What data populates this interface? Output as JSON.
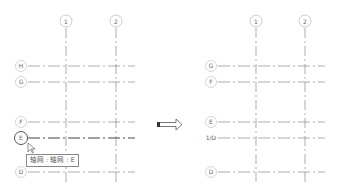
{
  "before": {
    "columns": [
      {
        "label": "1",
        "x": 66
      },
      {
        "label": "2",
        "x": 116
      }
    ],
    "rows": [
      {
        "label": "H",
        "y": 66
      },
      {
        "label": "G",
        "y": 82
      },
      {
        "label": "F",
        "y": 122
      },
      {
        "label": "E",
        "y": 138,
        "selected": true
      },
      {
        "label": "D",
        "y": 172
      }
    ],
    "tooltip": "轴网 : 轴网 : E"
  },
  "after": {
    "columns": [
      {
        "label": "1",
        "x": 256
      },
      {
        "label": "2",
        "x": 305
      }
    ],
    "rows": [
      {
        "label": "G",
        "y": 66
      },
      {
        "label": "F",
        "y": 82
      },
      {
        "label": "E",
        "y": 122
      },
      {
        "label": "1/D",
        "y": 138
      },
      {
        "label": "D",
        "y": 172
      }
    ]
  },
  "arrow": {
    "direction": "right"
  }
}
